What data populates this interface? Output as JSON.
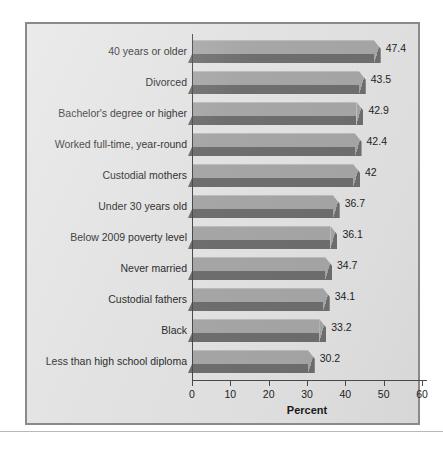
{
  "figure": {
    "panel_bg": "#e2e2e2",
    "panel_border": "#8a8a8a",
    "bar_top_color": "#a6a6a6",
    "bar_front_color": "#6e6e6e",
    "axis_color": "#4a4a4a"
  },
  "chart_data": {
    "type": "bar",
    "orientation": "horizontal",
    "title": "",
    "subtitle": "",
    "xlabel": "Percent",
    "ylabel": "",
    "xlim": [
      0,
      60
    ],
    "xticks": [
      0,
      10,
      20,
      30,
      40,
      50,
      60
    ],
    "xtick_labels": [
      "0",
      "10",
      "20",
      "30",
      "40",
      "50",
      "60"
    ],
    "grid": false,
    "legend": false,
    "legend_position": "none",
    "style": "3d-extruded-bars",
    "categories": [
      "40 years or older",
      "Divorced",
      "Bachelor's degree or higher",
      "Worked full-time, year-round",
      "Custodial mothers",
      "Under 30 years old",
      "Below 2009 poverty level",
      "Never married",
      "Custodial fathers",
      "Black",
      "Less than high school diploma"
    ],
    "values": [
      47.4,
      43.5,
      42.9,
      42.4,
      42,
      36.7,
      36.1,
      34.7,
      34.1,
      33.2,
      30.2
    ],
    "value_labels": [
      "47.4",
      "43.5",
      "42.9",
      "42.4",
      "42",
      "36.7",
      "36.1",
      "34.7",
      "34.1",
      "33.2",
      "30.2"
    ]
  }
}
